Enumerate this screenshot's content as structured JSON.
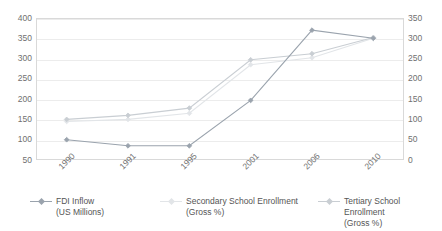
{
  "chart_data": {
    "type": "line",
    "title": "",
    "xlabel": "",
    "ylabel": "",
    "grid": true,
    "legend_position": "bottom",
    "categories": [
      "1990",
      "1991",
      "1995",
      "2001",
      "2006",
      "2010"
    ],
    "axes": {
      "left": {
        "label": "FDI Inflow (US Millions)",
        "ticks": [
          "50",
          "100",
          "150",
          "200",
          "250",
          "300",
          "350",
          "400"
        ],
        "min": 50,
        "max": 400
      },
      "right": {
        "label": "School Enrollment (Gross %)",
        "ticks": [
          "0",
          "50",
          "100",
          "150",
          "200",
          "250",
          "300",
          "350"
        ],
        "min": 0,
        "max": 350
      }
    },
    "series": [
      {
        "name": "FDI Inflow\n(US Millions)",
        "axis": "left",
        "color": "#9aa3ad",
        "values": [
          100,
          85,
          85,
          197,
          370,
          350
        ]
      },
      {
        "name": "Secondary School Enrollment\n(Gross %)",
        "axis": "right",
        "color": "#e2e5e8",
        "values": [
          95,
          100,
          115,
          235,
          252,
          300
        ]
      },
      {
        "name": "Tertiary School Enrollment\n(Gross %)",
        "axis": "right",
        "color": "#c9ced3",
        "values": [
          100,
          110,
          128,
          247,
          262,
          302
        ]
      }
    ]
  },
  "legend": {
    "items": [
      {
        "label": "FDI Inflow\n(US Millions)",
        "color": "#9aa3ad"
      },
      {
        "label": "Secondary School Enrollment\n(Gross %)",
        "color": "#e2e5e8"
      },
      {
        "label": "Tertiary School Enrollment\n(Gross %)",
        "color": "#c9ced3"
      }
    ]
  }
}
